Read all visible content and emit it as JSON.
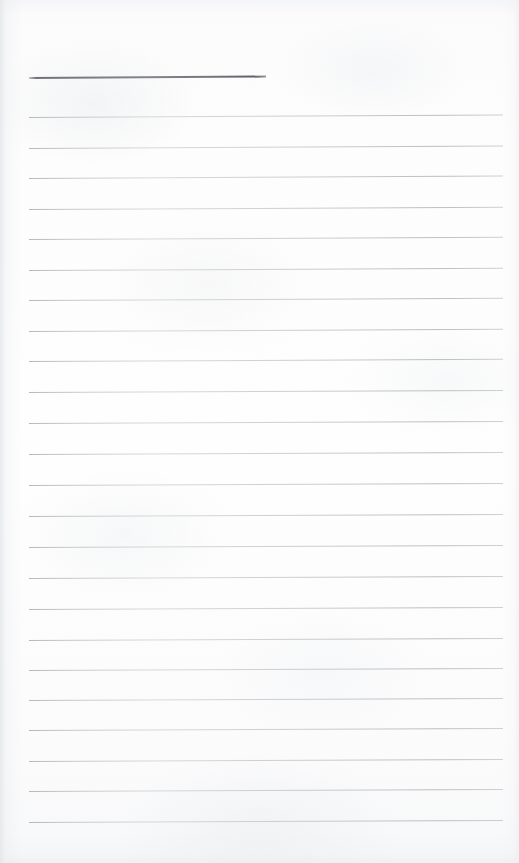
{
  "document": {
    "kind": "scanned-lined-notepad-page",
    "title": "Blank Lined Notepad Page",
    "description": "Scanned blank sheet of ruled notepad paper with a heavier header rule near the top and faint ruled writing lines below.",
    "content_text": "",
    "page_width": 519,
    "page_height": 863,
    "paper_color": "#fdfdfd",
    "rule_color": "#babdc1",
    "header_rule_color": "#6a6c71",
    "rule_count": 24,
    "rule_spacing": 30.6,
    "rule_left": 29,
    "rule_right": 503,
    "handwriting": "none",
    "text_blocks": []
  },
  "header_rule": {
    "name": "header rule",
    "left": 29,
    "top": 77,
    "width": 237,
    "tilt_degrees": -0.35
  },
  "rules": [
    {
      "index": 1,
      "left": 29,
      "top": 117,
      "width": 474,
      "tilt_degrees": -0.3
    },
    {
      "index": 2,
      "left": 29,
      "top": 148,
      "width": 474,
      "tilt_degrees": -0.3
    },
    {
      "index": 3,
      "left": 29,
      "top": 178,
      "width": 474,
      "tilt_degrees": -0.3
    },
    {
      "index": 4,
      "left": 29,
      "top": 209,
      "width": 474,
      "tilt_degrees": -0.28
    },
    {
      "index": 5,
      "left": 29,
      "top": 239,
      "width": 474,
      "tilt_degrees": -0.28
    },
    {
      "index": 6,
      "left": 29,
      "top": 270,
      "width": 474,
      "tilt_degrees": -0.28
    },
    {
      "index": 7,
      "left": 29,
      "top": 300,
      "width": 474,
      "tilt_degrees": -0.26
    },
    {
      "index": 8,
      "left": 29,
      "top": 331,
      "width": 474,
      "tilt_degrees": -0.26
    },
    {
      "index": 9,
      "left": 29,
      "top": 361,
      "width": 474,
      "tilt_degrees": -0.26
    },
    {
      "index": 10,
      "left": 29,
      "top": 392,
      "width": 474,
      "tilt_degrees": -0.24
    },
    {
      "index": 11,
      "left": 29,
      "top": 423,
      "width": 474,
      "tilt_degrees": -0.24
    },
    {
      "index": 12,
      "left": 29,
      "top": 454,
      "width": 474,
      "tilt_degrees": -0.24
    },
    {
      "index": 13,
      "left": 29,
      "top": 485,
      "width": 474,
      "tilt_degrees": -0.24
    },
    {
      "index": 14,
      "left": 29,
      "top": 516,
      "width": 474,
      "tilt_degrees": -0.24
    },
    {
      "index": 15,
      "left": 29,
      "top": 547,
      "width": 474,
      "tilt_degrees": -0.24
    },
    {
      "index": 16,
      "left": 29,
      "top": 578,
      "width": 474,
      "tilt_degrees": -0.24
    },
    {
      "index": 17,
      "left": 29,
      "top": 609,
      "width": 474,
      "tilt_degrees": -0.24
    },
    {
      "index": 18,
      "left": 29,
      "top": 640,
      "width": 474,
      "tilt_degrees": -0.24
    },
    {
      "index": 19,
      "left": 29,
      "top": 670,
      "width": 474,
      "tilt_degrees": -0.24
    },
    {
      "index": 20,
      "left": 29,
      "top": 700,
      "width": 474,
      "tilt_degrees": -0.24
    },
    {
      "index": 21,
      "left": 29,
      "top": 730,
      "width": 474,
      "tilt_degrees": -0.24
    },
    {
      "index": 22,
      "left": 29,
      "top": 761,
      "width": 474,
      "tilt_degrees": -0.24
    },
    {
      "index": 23,
      "left": 29,
      "top": 791,
      "width": 474,
      "tilt_degrees": -0.24
    },
    {
      "index": 24,
      "left": 29,
      "top": 822,
      "width": 474,
      "tilt_degrees": -0.24
    }
  ]
}
